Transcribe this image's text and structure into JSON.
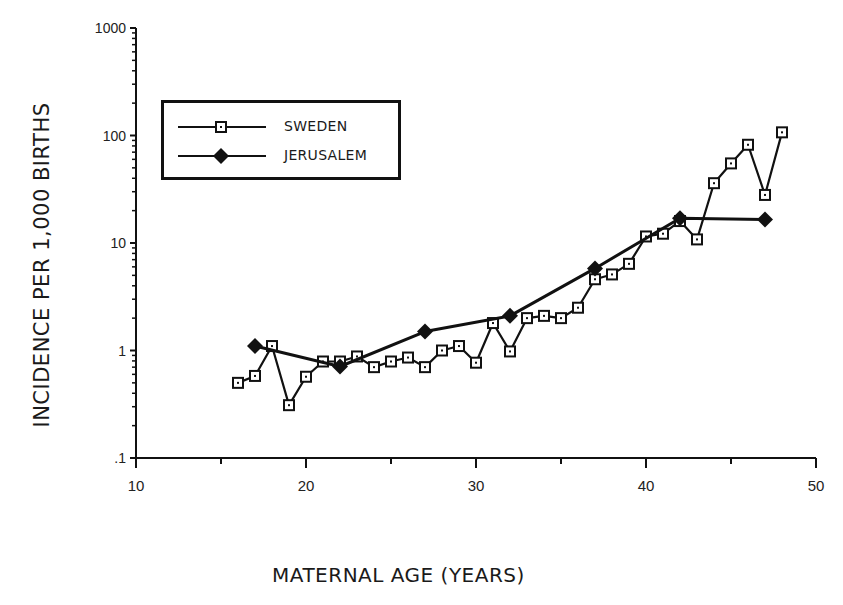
{
  "chart_data": {
    "type": "line",
    "title": "",
    "xlabel": "MATERNAL AGE (YEARS)",
    "ylabel": "INCIDENCE PER 1,000 BIRTHS",
    "xlim": [
      10,
      50
    ],
    "ylim": [
      0.1,
      1000
    ],
    "yscale": "log",
    "x_ticks": [
      "10",
      "20",
      "30",
      "40",
      "50"
    ],
    "y_ticks": [
      ".1",
      "1",
      "10",
      "100",
      "1000"
    ],
    "grid": false,
    "legend_position": "upper left",
    "series": [
      {
        "name": "SWEDEN",
        "marker": "open-square",
        "x": [
          16,
          17,
          18,
          19,
          20,
          21,
          22,
          23,
          24,
          25,
          26,
          27,
          28,
          29,
          30,
          31,
          32,
          33,
          34,
          35,
          36,
          37,
          38,
          39,
          40,
          41,
          42,
          43,
          44,
          45,
          46,
          47,
          48
        ],
        "values": [
          0.5,
          0.58,
          1.1,
          0.31,
          0.57,
          0.79,
          0.79,
          0.88,
          0.7,
          0.79,
          0.86,
          0.7,
          1.0,
          1.1,
          0.77,
          1.8,
          0.98,
          2.0,
          2.1,
          2.0,
          2.5,
          4.6,
          5.1,
          6.4,
          11.5,
          12.2,
          16,
          10.8,
          36,
          55,
          82,
          28,
          107
        ]
      },
      {
        "name": "JERUSALEM",
        "marker": "filled-diamond",
        "x": [
          17,
          22,
          27,
          32,
          37,
          42,
          47
        ],
        "values": [
          1.1,
          0.71,
          1.5,
          2.1,
          5.8,
          17,
          16.5
        ]
      }
    ]
  },
  "legend": {
    "items": [
      {
        "label": "SWEDEN"
      },
      {
        "label": "JERUSALEM"
      }
    ]
  },
  "colors": {
    "ink": "#111111",
    "background": "#ffffff"
  }
}
